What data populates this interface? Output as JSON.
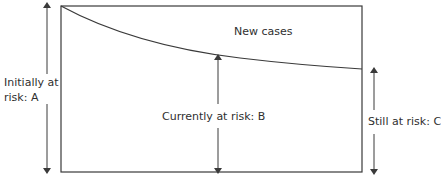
{
  "diagram": {
    "curve_label": "New cases",
    "labels": {
      "a_line1": "Initially at",
      "a_line2": "risk: A",
      "b": "Currently at risk: B",
      "c": "Still at risk: C"
    },
    "colors": {
      "line": "#3a3a3a",
      "text": "#2f2f2f",
      "background": "#ffffff"
    }
  }
}
